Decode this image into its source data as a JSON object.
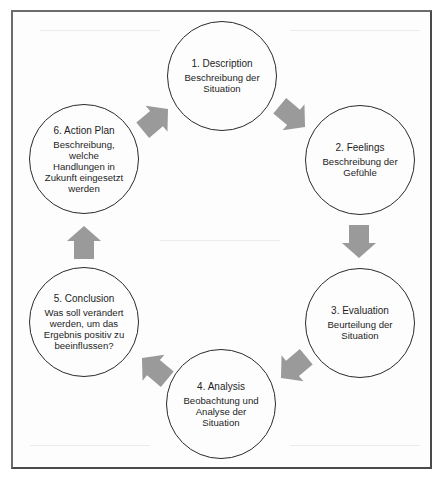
{
  "diagram": {
    "type": "cycle",
    "arrow_color": "#9a9a9a",
    "stroke_color": "#2a2a2a",
    "nodes": [
      {
        "id": 1,
        "title": "1. Description",
        "description": "Beschreibung der Situation"
      },
      {
        "id": 2,
        "title": "2. Feelings",
        "description": "Beschreibung der Gefühle"
      },
      {
        "id": 3,
        "title": "3. Evaluation",
        "description": "Beurteilung der Situation"
      },
      {
        "id": 4,
        "title": "4. Analysis",
        "description": "Beobachtung und Analyse der Situation"
      },
      {
        "id": 5,
        "title": "5. Conclusion",
        "description": "Was soll verändert werden, um das Ergebnis positiv zu beeinflussen?"
      },
      {
        "id": 6,
        "title": "6. Action Plan",
        "description": "Beschreibung, welche Handlungen in Zukunft eingesetzt werden"
      }
    ],
    "edges": [
      {
        "from": 1,
        "to": 2,
        "direction": "down-right"
      },
      {
        "from": 2,
        "to": 3,
        "direction": "down"
      },
      {
        "from": 3,
        "to": 4,
        "direction": "down-left"
      },
      {
        "from": 4,
        "to": 5,
        "direction": "up-left"
      },
      {
        "from": 5,
        "to": 6,
        "direction": "up"
      },
      {
        "from": 6,
        "to": 1,
        "direction": "up-right"
      }
    ]
  }
}
